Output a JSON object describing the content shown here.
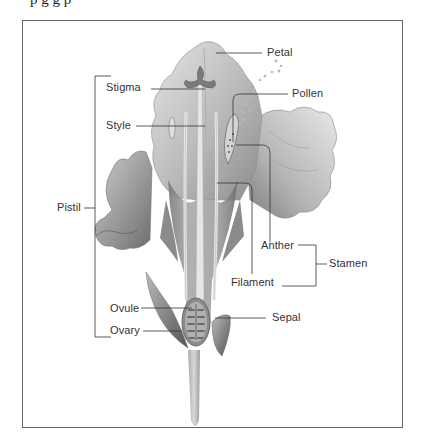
{
  "figure": {
    "clipped_caption": "p         g      g  p",
    "frame_color": "#666666",
    "ink_color": "#333333",
    "labels": {
      "petal": "Petal",
      "stigma": "Stigma",
      "pollen": "Pollen",
      "style": "Style",
      "pistil": "Pistil",
      "anther": "Anther",
      "stamen": "Stamen",
      "filament": "Filament",
      "ovule": "Ovule",
      "sepal": "Sepal",
      "ovary": "Ovary"
    },
    "groups": {
      "pistil": [
        "Stigma",
        "Style",
        "Ovule",
        "Ovary"
      ],
      "stamen": [
        "Anther",
        "Filament"
      ]
    }
  }
}
